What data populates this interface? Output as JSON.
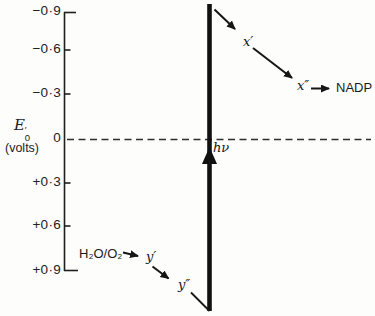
{
  "figure": {
    "axis": {
      "symbol": "E",
      "prime": "′",
      "sub": "0",
      "unit": "(volts)",
      "ticks": [
        {
          "label": "−0·9"
        },
        {
          "label": "−0·6"
        },
        {
          "label": "−0·3"
        },
        {
          "label": "0"
        },
        {
          "label": "+0·3"
        },
        {
          "label": "+0·6"
        },
        {
          "label": "+0·9"
        }
      ]
    },
    "nodes": {
      "photon": "hν",
      "x1": "x′",
      "x2": "x″",
      "nadp": "NADP",
      "water": "H₂O/O₂",
      "y1": "y′",
      "y2": "y″"
    },
    "arrows": [
      {
        "from": "H₂O/O₂",
        "to": "y′"
      },
      {
        "from": "y′",
        "to": "y″"
      },
      {
        "from": "y″",
        "to": "electron-boost-bottom"
      },
      {
        "from": "electron-boost-bottom",
        "to": "electron-boost-top",
        "label": "hν",
        "style": "thick-vertical"
      },
      {
        "from": "electron-boost-top",
        "to": "x′"
      },
      {
        "from": "x′",
        "to": "x″"
      },
      {
        "from": "x″",
        "to": "NADP"
      }
    ],
    "ink_color": "#161616",
    "dashed_line_color": "#2e2e2e"
  }
}
